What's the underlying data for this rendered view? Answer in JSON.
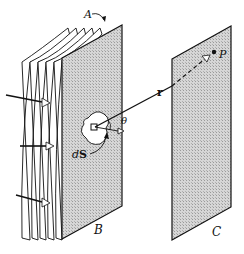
{
  "figure": {
    "labels": {
      "wavefront": "A",
      "screen_aperture": "B",
      "screen_observation": "C",
      "point": "P",
      "vector": "r",
      "angle": "θ",
      "area_element_d": "d",
      "area_element_S": "S"
    },
    "colors": {
      "ink": "#111111",
      "plate_fill": "#c8c8c8",
      "background": "#ffffff"
    },
    "incident_arrows": 3,
    "wavefront_sheets": 5
  }
}
